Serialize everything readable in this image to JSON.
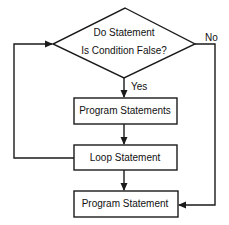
{
  "diagram": {
    "type": "flowchart",
    "decision": {
      "line1": "Do Statement",
      "line2": "Is Condition False?"
    },
    "edges": {
      "yes_label": "Yes",
      "no_label": "No"
    },
    "boxes": [
      {
        "label": "Program Statements"
      },
      {
        "label": "Loop Statement"
      },
      {
        "label": "Program Statement"
      }
    ],
    "colors": {
      "stroke": "#1a1a1a",
      "background": "#ffffff",
      "text": "#111111"
    }
  }
}
